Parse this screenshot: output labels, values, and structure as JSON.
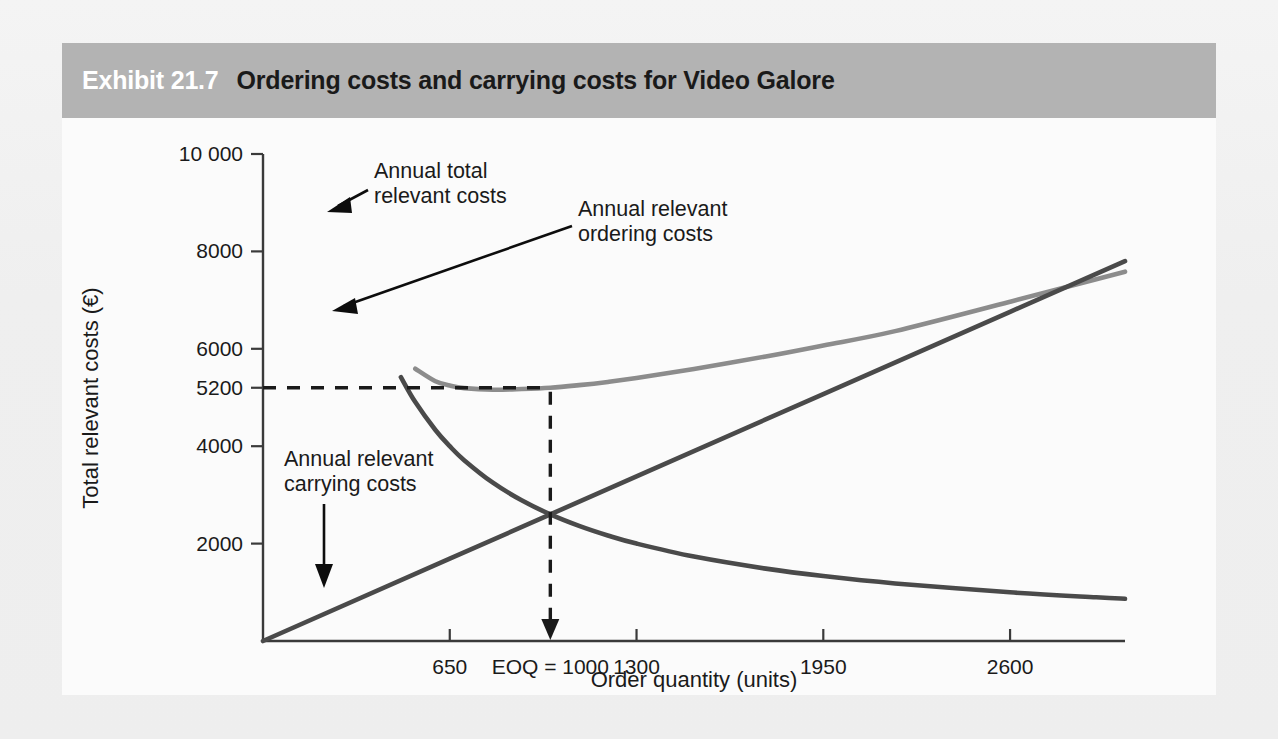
{
  "exhibit": {
    "number": "Exhibit 21.7",
    "title": "Ordering costs and carrying costs for Video Galore"
  },
  "colors": {
    "banner": "#b3b3b3",
    "page_background": "#f2f2f2",
    "chart_background": "#fbfbfb",
    "total_cost_line": "#8c8c8c",
    "ordering_cost_line": "#4a4a4a",
    "carrying_cost_line": "#4a4a4a",
    "axis": "#3a3a3a",
    "guide_dash": "#1a1a1a"
  },
  "chart_data": {
    "type": "line",
    "title": "Ordering costs and carrying costs for Video Galore",
    "xlabel": "Order quantity (units)",
    "ylabel": "Total relevant costs (€)",
    "xlim": [
      0,
      3000
    ],
    "ylim": [
      0,
      10000
    ],
    "grid": false,
    "legend_position": "inline-annotations",
    "x_ticks": [
      650,
      1000,
      1300,
      1950,
      2600
    ],
    "x_tick_labels": [
      "650",
      "EOQ = 1000",
      "1300",
      "1950",
      "2600"
    ],
    "y_ticks": [
      2000,
      4000,
      5200,
      6000,
      8000,
      10000
    ],
    "y_tick_labels": [
      "2000",
      "4000",
      "5200",
      "6000",
      "8000",
      "10 000"
    ],
    "eoq": 1000,
    "eoq_total_cost": 5200,
    "eoq_crossing_cost": 2600,
    "annotations": [
      {
        "name": "annual-total-relevant-costs",
        "line1": "Annual total",
        "line2": "relevant costs"
      },
      {
        "name": "annual-relevant-ordering-costs",
        "line1": "Annual relevant",
        "line2": "ordering costs"
      },
      {
        "name": "annual-relevant-carrying-costs",
        "line1": "Annual relevant",
        "line2": "carrying costs"
      }
    ],
    "series": [
      {
        "name": "Annual total relevant costs",
        "color": "#8c8c8c",
        "x": [
          530,
          600,
          650,
          700,
          800,
          900,
          1000,
          1100,
          1200,
          1300,
          1500,
          1750,
          1950,
          2200,
          2600,
          2900,
          3000
        ],
        "values": [
          5590,
          5333,
          5246,
          5193,
          5160,
          5173,
          5200,
          5254,
          5320,
          5400,
          5587,
          5843,
          6069,
          6363,
          6966,
          7426,
          7583
        ]
      },
      {
        "name": "Annual relevant ordering costs",
        "color": "#4a4a4a",
        "x": [
          480,
          530,
          600,
          650,
          700,
          800,
          900,
          1000,
          1100,
          1200,
          1300,
          1500,
          1750,
          1950,
          2200,
          2600,
          2900,
          3000
        ],
        "values": [
          5417,
          4906,
          4333,
          4000,
          3714,
          3250,
          2889,
          2600,
          2364,
          2167,
          2000,
          1733,
          1486,
          1333,
          1182,
          1000,
          897,
          867
        ]
      },
      {
        "name": "Annual relevant carrying costs",
        "color": "#4a4a4a",
        "x": [
          0,
          650,
          1000,
          1300,
          1950,
          2600,
          3000
        ],
        "values": [
          0,
          1690,
          2600,
          3380,
          5070,
          6760,
          7800
        ]
      }
    ]
  }
}
